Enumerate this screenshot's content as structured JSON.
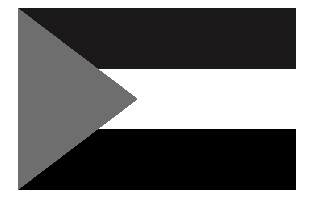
{
  "image": {
    "kind": "flag-illustration",
    "subject": "horizontal tricolor flag with hoist-side triangle",
    "alt_text": "Flag with three horizontal bands and a triangle at the hoist",
    "canvas": {
      "width": 311,
      "height": 206,
      "background_color": "#ffffff"
    }
  },
  "flag": {
    "x": 18,
    "y": 8,
    "width": 278,
    "height": 182,
    "bands": [
      {
        "name": "top-band",
        "color": "#1a1818",
        "y": 0,
        "height": 60.7
      },
      {
        "name": "middle-band",
        "color": "#ffffff",
        "y": 60.7,
        "height": 60.6
      },
      {
        "name": "bottom-band",
        "color": "#000000",
        "y": 121.3,
        "height": 60.7
      }
    ],
    "triangle": {
      "name": "hoist-triangle",
      "color": "#6e6e6e",
      "apex_x": 120,
      "apex_y": 91,
      "base_x": 0,
      "base_top_y": 0,
      "base_bottom_y": 182
    },
    "border": {
      "color": "#ffffff",
      "width": 0
    }
  }
}
